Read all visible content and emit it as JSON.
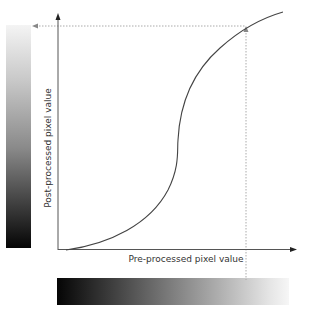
{
  "diagram": {
    "x_axis_label": "Pre-processed pixel value",
    "y_axis_label": "Post-processed pixel value",
    "input_gradient": {
      "from": "#050505",
      "to": "#f6f6f6",
      "orientation": "horizontal"
    },
    "output_gradient": {
      "from": "#050505",
      "to": "#f4f4f4",
      "orientation": "vertical"
    },
    "curve": {
      "shape": "S-curve",
      "color": "#444444"
    },
    "guide_lines": {
      "style": "dotted",
      "color": "#aaaaaa"
    },
    "axis_color": "#555555"
  }
}
